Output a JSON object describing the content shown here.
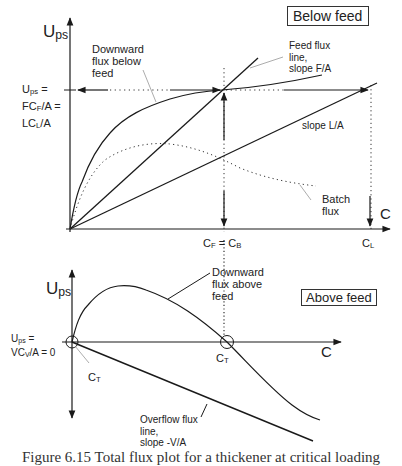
{
  "top_plot": {
    "y_axis_label": "U",
    "y_axis_label_sub": "ps",
    "x_axis_label": "C",
    "region_box": "Below feed",
    "ups_label_lines": [
      {
        "pre": "U",
        "sub": "ps",
        "post": " ="
      },
      {
        "pre": "FC",
        "sub": "F",
        "post": "/A ="
      },
      {
        "pre": "LC",
        "sub": "L",
        "post": "/A"
      }
    ],
    "annotations": {
      "downward_flux_below_feed": [
        "Downward",
        "flux below",
        "feed"
      ],
      "feed_flux_line": [
        "Feed flux",
        "line,",
        "slope F/A"
      ],
      "slope_la": "slope L/A",
      "batch_flux": [
        "Batch",
        "flux"
      ]
    },
    "x_ticks": {
      "cf_cb": {
        "c1": "C",
        "s1": "F",
        "eq": " = ",
        "c2": "C",
        "s2": "B"
      },
      "cl": {
        "c": "C",
        "s": "L"
      }
    }
  },
  "bottom_plot": {
    "y_axis_label": "U",
    "y_axis_label_sub": "ps",
    "x_axis_label": "C",
    "region_box": "Above feed",
    "ups_label_lines": [
      {
        "pre": "U",
        "sub": "ps",
        "post": " ="
      },
      {
        "pre": "VC",
        "sub": "V",
        "post": "/A = 0"
      }
    ],
    "annotations": {
      "downward_flux_above_feed": [
        "Downward",
        "flux above",
        "feed"
      ],
      "overflow_flux_line": [
        "Overflow flux",
        "line,",
        "slope -V/A"
      ]
    },
    "ct_label": {
      "c": "C",
      "s": "T"
    }
  },
  "caption": "Figure 6.15  Total flux plot for a thickener at critical loading"
}
